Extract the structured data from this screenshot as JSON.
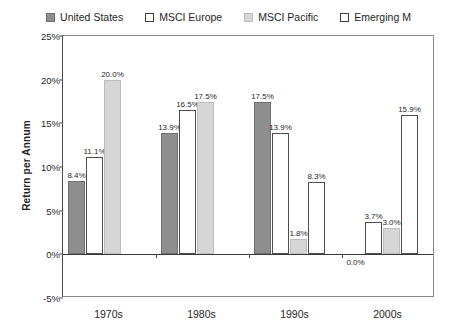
{
  "chart_data": {
    "type": "bar",
    "title": "",
    "xlabel": "",
    "ylabel": "Return per Annum",
    "categories": [
      "1970s",
      "1980s",
      "1990s",
      "2000s"
    ],
    "ylim": [
      -5,
      25
    ],
    "ytick_values": [
      25,
      20,
      15,
      10,
      5,
      0,
      -5
    ],
    "ytick_labels": [
      "25%",
      "20%",
      "15%",
      "10%",
      "5%",
      "0%",
      "-5%"
    ],
    "grid": false,
    "legend_position": "top",
    "series": [
      {
        "name": "United States",
        "swatch_style": "solid",
        "color": "#8e8e8e",
        "border": "#6f6f6f",
        "values": [
          8.4,
          13.9,
          17.5,
          0.0
        ],
        "labels": [
          "8.4%",
          "13.9%",
          "17.5%",
          "0.0%"
        ]
      },
      {
        "name": "MSCI Europe",
        "swatch_style": "outline",
        "color": "#ffffff",
        "border": "#4d4d4d",
        "values": [
          11.1,
          16.5,
          13.9,
          3.7
        ],
        "labels": [
          "11.1%",
          "16.5%",
          "13.9%",
          "3.7%"
        ]
      },
      {
        "name": "MSCI Pacific",
        "swatch_style": "solid",
        "color": "#d6d6d6",
        "border": "#bdbdbd",
        "values": [
          20.0,
          17.5,
          1.8,
          3.0
        ],
        "labels": [
          "20.0%",
          "17.5%",
          "1.8%",
          "3.0%"
        ]
      },
      {
        "name": "Emerging M",
        "swatch_style": "outline",
        "color": "#ffffff",
        "border": "#4d4d4d",
        "values": [
          null,
          null,
          8.3,
          15.9
        ],
        "labels": [
          "",
          "",
          "8.3%",
          "15.9%"
        ]
      }
    ]
  },
  "legend": {
    "entries": [
      {
        "label": "United States"
      },
      {
        "label": "MSCI Europe"
      },
      {
        "label": "MSCI Pacific"
      },
      {
        "label": "Emerging M"
      }
    ]
  },
  "axis": {
    "y_title": "Return per Annum"
  }
}
